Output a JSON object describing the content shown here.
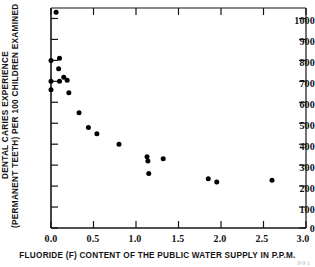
{
  "chart_data": {
    "type": "scatter",
    "title": "",
    "xlabel": "FLUORIDE (F) CONTENT OF THE PUBLIC WATER SUPPLY IN P.P.M.",
    "ylabel_line1": "DENTAL CARIES EXPERIENCE",
    "ylabel_line2": "(PERMANENT TEETH) PER 100 CHILDREN EXAMINED",
    "xlim": [
      0.0,
      3.0
    ],
    "ylim": [
      0,
      1050
    ],
    "xticks": [
      0.0,
      0.5,
      1.0,
      1.5,
      2.0,
      2.5,
      3.0
    ],
    "xticklabels": [
      "0.0",
      "0.5",
      "1.0",
      "1.5",
      "2.0",
      "2.5",
      "3.0"
    ],
    "yticks": [
      0,
      100,
      200,
      300,
      400,
      500,
      600,
      700,
      800,
      900,
      1000
    ],
    "yticklabels": [
      "0",
      "100",
      "200",
      "300",
      "400",
      "500",
      "600",
      "700",
      "800",
      "900",
      "1000"
    ],
    "grid": false,
    "legend": false,
    "marker": "filled-circle",
    "marker_color": "#000000",
    "points": [
      {
        "x": 0.06,
        "y": 1030
      },
      {
        "x": 0.0,
        "y": 800
      },
      {
        "x": 0.1,
        "y": 810
      },
      {
        "x": 0.09,
        "y": 760
      },
      {
        "x": 0.0,
        "y": 700
      },
      {
        "x": 0.15,
        "y": 720
      },
      {
        "x": 0.19,
        "y": 705
      },
      {
        "x": 0.1,
        "y": 700
      },
      {
        "x": 0.0,
        "y": 660
      },
      {
        "x": 0.21,
        "y": 645
      },
      {
        "x": 0.33,
        "y": 550
      },
      {
        "x": 0.44,
        "y": 480
      },
      {
        "x": 0.54,
        "y": 450
      },
      {
        "x": 0.8,
        "y": 400
      },
      {
        "x": 1.13,
        "y": 340
      },
      {
        "x": 1.14,
        "y": 320
      },
      {
        "x": 1.15,
        "y": 260
      },
      {
        "x": 1.32,
        "y": 330
      },
      {
        "x": 1.85,
        "y": 235
      },
      {
        "x": 1.95,
        "y": 220
      },
      {
        "x": 2.6,
        "y": 228
      }
    ]
  },
  "axes": {
    "x_tick_labels": [
      "0.0",
      "0.5",
      "1.0",
      "1.5",
      "2.0",
      "2.5",
      "3.0"
    ],
    "y_tick_labels": [
      "1000",
      "900",
      "800",
      "700",
      "600",
      "500",
      "400",
      "300",
      "200",
      "100",
      "0"
    ]
  },
  "footer": {
    "page_mark": "991"
  },
  "colors": {
    "axis": "#141414",
    "marker": "#000000",
    "background": "#ffffff",
    "text": "#111111"
  }
}
